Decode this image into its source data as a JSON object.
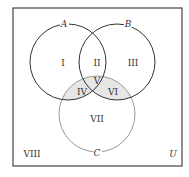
{
  "diagram": {
    "type": "venn",
    "universe_label": "U",
    "sets": [
      {
        "name": "A",
        "cx": 68,
        "cy": 62,
        "r": 38,
        "stroke": "#333333"
      },
      {
        "name": "B",
        "cx": 117,
        "cy": 62,
        "r": 38,
        "stroke": "#333333"
      },
      {
        "name": "C",
        "cx": 97,
        "cy": 114,
        "r": 38,
        "stroke": "#999999"
      }
    ],
    "regions": {
      "r1": "I",
      "r2": "II",
      "r3": "III",
      "r4": "IV",
      "r5": "V",
      "r6": "VI",
      "r7": "VII",
      "r8": "VIII"
    },
    "shaded_regions": [
      "IV",
      "V",
      "VI"
    ],
    "shade_color": "#e6e6e6"
  }
}
